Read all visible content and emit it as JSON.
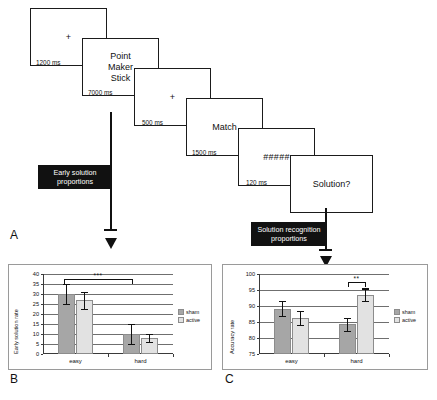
{
  "figure": {
    "panel_labels": {
      "a": "A",
      "b": "B",
      "c": "C"
    }
  },
  "panel_a": {
    "name": "trial-sequence-diagram",
    "screens": [
      {
        "id": "fixation-1",
        "content": "+",
        "duration": "1200 ms",
        "type": "fixation"
      },
      {
        "id": "word-triad",
        "content": "Point\nMaker\nStick",
        "duration": "7000 ms",
        "type": "words"
      },
      {
        "id": "fixation-2",
        "content": "+",
        "duration": "500 ms",
        "type": "fixation"
      },
      {
        "id": "solution-word",
        "content": "Match",
        "duration": "1500 ms",
        "type": "words"
      },
      {
        "id": "mask",
        "content": "#####",
        "duration": "120 ms",
        "type": "mask"
      },
      {
        "id": "probe",
        "content": "Solution?",
        "duration": "",
        "type": "words"
      }
    ],
    "callouts": [
      {
        "id": "early-solution-callout",
        "line1": "Early solution",
        "line2": "proportions"
      },
      {
        "id": "solution-recognition-callout",
        "line1": "Solution recognition",
        "line2": "proportions"
      }
    ]
  },
  "chart_data": [
    {
      "panel": "B",
      "type": "bar",
      "title": "",
      "ylabel": "Early solution rate",
      "xlabel": "",
      "categories": [
        "easy",
        "hard"
      ],
      "ylim": [
        0,
        40
      ],
      "yticks": [
        0,
        5,
        10,
        15,
        20,
        25,
        30,
        35,
        40
      ],
      "grid": true,
      "legend_position": "right",
      "series": [
        {
          "name": "sham",
          "color": "#a6a6a6",
          "values": [
            30.0,
            10.2
          ],
          "errors": [
            5.0,
            5.0
          ]
        },
        {
          "name": "active",
          "color": "#e2e2e2",
          "values": [
            26.8,
            8.0
          ],
          "errors": [
            4.4,
            2.1
          ]
        }
      ],
      "annotations": [
        {
          "text": "***",
          "from": "easy",
          "to": "hard",
          "y": 37.5
        }
      ]
    },
    {
      "panel": "C",
      "type": "bar",
      "title": "",
      "ylabel": "Accuracy rate",
      "xlabel": "",
      "categories": [
        "easy",
        "hard"
      ],
      "ylim": [
        75,
        100
      ],
      "yticks": [
        75,
        80,
        85,
        90,
        95,
        100
      ],
      "grid": true,
      "legend_position": "right",
      "series": [
        {
          "name": "sham",
          "color": "#a6a6a6",
          "values": [
            89.2,
            84.3
          ],
          "errors": [
            2.3,
            2.0
          ]
        },
        {
          "name": "active",
          "color": "#e2e2e2",
          "values": [
            86.3,
            93.5
          ],
          "errors": [
            2.2,
            2.0
          ]
        }
      ],
      "annotations": [
        {
          "text": "**",
          "from": "hard-sham",
          "to": "hard-active",
          "y": 97.5
        }
      ]
    }
  ],
  "legend": {
    "sham": "sham",
    "active": "active"
  }
}
